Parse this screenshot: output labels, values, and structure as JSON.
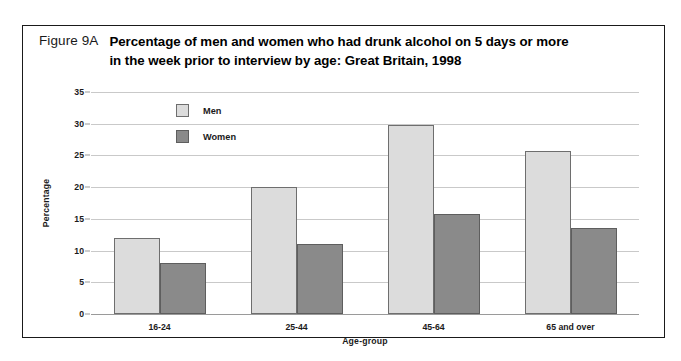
{
  "figure": {
    "number": "Figure 9A",
    "title_line_1": "Percentage of men and women who had drunk alcohol on 5 days or more",
    "title_line_2": "in the week prior to interview by age: Great Britain, 1998"
  },
  "colors": {
    "men_fill": "#dcdcdc",
    "women_fill": "#8a8a8a",
    "bar_border": "#6e6e6e",
    "gridline": "#c9c9c9",
    "frame": "#1a1a1a",
    "background": "#ffffff"
  },
  "chart_data": {
    "type": "bar",
    "title": "Percentage of men and women who had drunk alcohol on 5 days or more in the week prior to interview by age: Great Britain, 1998",
    "xlabel": "Age-group",
    "ylabel": "Percentage",
    "categories": [
      "16-24",
      "25-44",
      "45-64",
      "65 and over"
    ],
    "series": [
      {
        "name": "Men",
        "values": [
          12.0,
          20.0,
          29.8,
          25.7
        ]
      },
      {
        "name": "Women",
        "values": [
          8.0,
          11.0,
          15.8,
          13.6
        ]
      }
    ],
    "ylim": [
      0,
      35
    ],
    "ytick_step": 5,
    "yticks": [
      0,
      5,
      10,
      15,
      20,
      25,
      30,
      35
    ],
    "ytick_labels": [
      "0",
      "5",
      "10",
      "15",
      "20",
      "25",
      "30",
      "35"
    ],
    "grid": true,
    "legend_position": "inside-top-left",
    "legend": [
      "Men",
      "Women"
    ]
  }
}
